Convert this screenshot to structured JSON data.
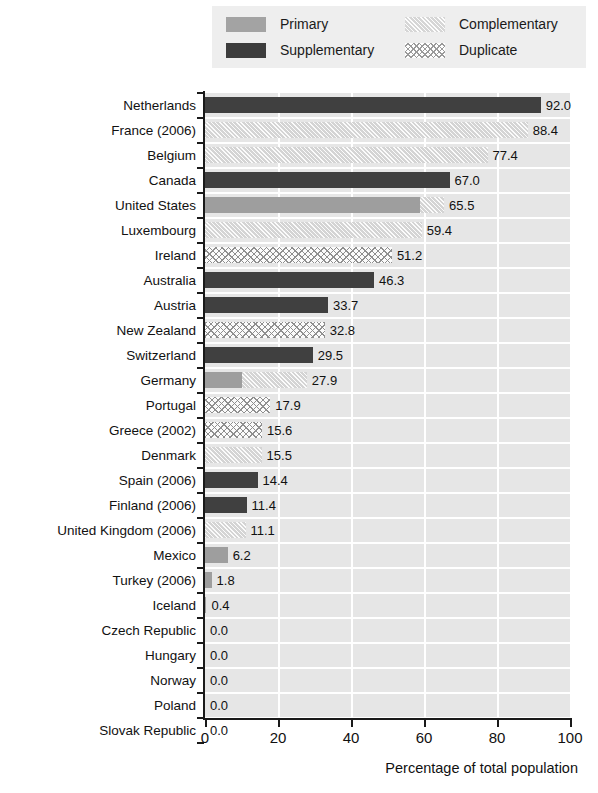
{
  "legend": {
    "items": [
      {
        "label": "Primary",
        "key": "primary",
        "color": "#9e9e9e",
        "pattern": "solid-gray"
      },
      {
        "label": "Supplementary",
        "key": "supplementary",
        "color": "#404040",
        "pattern": "solid-dark"
      },
      {
        "label": "Complementary",
        "key": "complementary",
        "color": "#d4d4d4",
        "pattern": "diagonal-hatch"
      },
      {
        "label": "Duplicate",
        "key": "duplicate",
        "color": "#fbfbfb",
        "pattern": "cross-hatch"
      }
    ]
  },
  "chart_data": {
    "type": "bar",
    "orientation": "horizontal",
    "title": "",
    "xlabel": "Percentage of total population",
    "ylabel": "",
    "xlim": [
      0,
      100
    ],
    "xticks": [
      "0",
      "20",
      "40",
      "60",
      "80",
      "100"
    ],
    "grid": "vertical-white-gridlines",
    "legend_position": "top",
    "series_keys": [
      "primary",
      "supplementary",
      "complementary",
      "duplicate"
    ],
    "categories": [
      "Netherlands",
      "France (2006)",
      "Belgium",
      "Canada",
      "United States",
      "Luxembourg",
      "Ireland",
      "Australia",
      "Austria",
      "New Zealand",
      "Switzerland",
      "Germany",
      "Portugal",
      "Greece (2002)",
      "Denmark",
      "Spain (2006)",
      "Finland (2006)",
      "United Kingdom (2006)",
      "Mexico",
      "Turkey (2006)",
      "Iceland",
      "Czech Republic",
      "Hungary",
      "Norway",
      "Poland",
      "Slovak Republic"
    ],
    "values": [
      92.0,
      88.4,
      77.4,
      67.0,
      65.5,
      59.4,
      51.2,
      46.3,
      33.7,
      32.8,
      29.5,
      27.9,
      17.9,
      15.6,
      15.5,
      14.4,
      11.4,
      11.1,
      6.2,
      1.8,
      0.4,
      0.0,
      0.0,
      0.0,
      0.0,
      0.0
    ],
    "value_labels": [
      "92.0",
      "88.4",
      "77.4",
      "67.0",
      "65.5",
      "59.4",
      "51.2",
      "46.3",
      "33.7",
      "32.8",
      "29.5",
      "27.9",
      "17.9",
      "15.6",
      "15.5",
      "14.4",
      "11.4",
      "11.1",
      "6.2",
      "1.8",
      "0.4",
      "0.0",
      "0.0",
      "0.0",
      "0.0",
      "0.0"
    ],
    "rows": [
      {
        "category": "Netherlands",
        "total": 92.0,
        "label": "92.0",
        "segments": [
          {
            "key": "supplementary",
            "value": 92.0
          }
        ]
      },
      {
        "category": "France (2006)",
        "total": 88.4,
        "label": "88.4",
        "segments": [
          {
            "key": "complementary",
            "value": 88.4
          }
        ]
      },
      {
        "category": "Belgium",
        "total": 77.4,
        "label": "77.4",
        "segments": [
          {
            "key": "complementary",
            "value": 77.4
          }
        ]
      },
      {
        "category": "Canada",
        "total": 67.0,
        "label": "67.0",
        "segments": [
          {
            "key": "supplementary",
            "value": 67.0
          }
        ]
      },
      {
        "category": "United States",
        "total": 65.5,
        "label": "65.5",
        "segments": [
          {
            "key": "primary",
            "value": 59.0
          },
          {
            "key": "complementary",
            "value": 6.5
          }
        ]
      },
      {
        "category": "Luxembourg",
        "total": 59.4,
        "label": "59.4",
        "segments": [
          {
            "key": "complementary",
            "value": 59.4
          }
        ]
      },
      {
        "category": "Ireland",
        "total": 51.2,
        "label": "51.2",
        "segments": [
          {
            "key": "duplicate",
            "value": 51.2
          }
        ]
      },
      {
        "category": "Australia",
        "total": 46.3,
        "label": "46.3",
        "segments": [
          {
            "key": "supplementary",
            "value": 46.3
          }
        ]
      },
      {
        "category": "Austria",
        "total": 33.7,
        "label": "33.7",
        "segments": [
          {
            "key": "supplementary",
            "value": 33.7
          }
        ]
      },
      {
        "category": "New Zealand",
        "total": 32.8,
        "label": "32.8",
        "segments": [
          {
            "key": "duplicate",
            "value": 32.8
          }
        ]
      },
      {
        "category": "Switzerland",
        "total": 29.5,
        "label": "29.5",
        "segments": [
          {
            "key": "supplementary",
            "value": 29.5
          }
        ]
      },
      {
        "category": "Germany",
        "total": 27.9,
        "label": "27.9",
        "segments": [
          {
            "key": "primary",
            "value": 10.2
          },
          {
            "key": "complementary",
            "value": 17.7
          }
        ]
      },
      {
        "category": "Portugal",
        "total": 17.9,
        "label": "17.9",
        "segments": [
          {
            "key": "duplicate",
            "value": 17.9
          }
        ]
      },
      {
        "category": "Greece (2002)",
        "total": 15.6,
        "label": "15.6",
        "segments": [
          {
            "key": "duplicate",
            "value": 15.6
          }
        ]
      },
      {
        "category": "Denmark",
        "total": 15.5,
        "label": "15.5",
        "segments": [
          {
            "key": "complementary",
            "value": 15.5
          }
        ]
      },
      {
        "category": "Spain (2006)",
        "total": 14.4,
        "label": "14.4",
        "segments": [
          {
            "key": "supplementary",
            "value": 14.4
          }
        ]
      },
      {
        "category": "Finland (2006)",
        "total": 11.4,
        "label": "11.4",
        "segments": [
          {
            "key": "supplementary",
            "value": 11.4
          }
        ]
      },
      {
        "category": "United Kingdom (2006)",
        "total": 11.1,
        "label": "11.1",
        "segments": [
          {
            "key": "complementary",
            "value": 11.1
          }
        ]
      },
      {
        "category": "Mexico",
        "total": 6.2,
        "label": "6.2",
        "segments": [
          {
            "key": "primary",
            "value": 6.2
          }
        ]
      },
      {
        "category": "Turkey (2006)",
        "total": 1.8,
        "label": "1.8",
        "segments": [
          {
            "key": "primary",
            "value": 1.8
          }
        ]
      },
      {
        "category": "Iceland",
        "total": 0.4,
        "label": "0.4",
        "segments": [
          {
            "key": "primary",
            "value": 0.4
          }
        ]
      },
      {
        "category": "Czech Republic",
        "total": 0.0,
        "label": "0.0",
        "segments": []
      },
      {
        "category": "Hungary",
        "total": 0.0,
        "label": "0.0",
        "segments": []
      },
      {
        "category": "Norway",
        "total": 0.0,
        "label": "0.0",
        "segments": []
      },
      {
        "category": "Poland",
        "total": 0.0,
        "label": "0.0",
        "segments": []
      },
      {
        "category": "Slovak Republic",
        "total": 0.0,
        "label": "0.0",
        "segments": []
      }
    ]
  }
}
